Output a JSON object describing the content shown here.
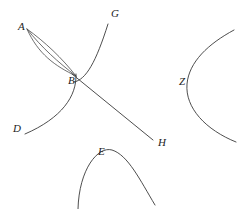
{
  "figure": {
    "background_color": "#ffffff",
    "stroke_color": "#3a3a3a",
    "label_color": "#1c1c1c",
    "width": 243,
    "height": 209,
    "labels": [
      {
        "id": "A",
        "text": "A",
        "x": 18,
        "y": 30
      },
      {
        "id": "B",
        "text": "B",
        "x": 68,
        "y": 84
      },
      {
        "id": "G",
        "text": "G",
        "x": 111,
        "y": 17
      },
      {
        "id": "D",
        "text": "D",
        "x": 13,
        "y": 132
      },
      {
        "id": "H",
        "text": "H",
        "x": 158,
        "y": 146
      },
      {
        "id": "E",
        "text": "E",
        "x": 98,
        "y": 155
      },
      {
        "id": "Z",
        "text": "Z",
        "x": 179,
        "y": 85
      }
    ],
    "curves": [
      {
        "id": "arc-A-B-upper",
        "from": "A",
        "to": "B",
        "path": "M 27 29 C 45 42, 62 58, 76 76"
      },
      {
        "id": "arc-A-B-middle",
        "from": "A",
        "to": "B",
        "path": "M 27 29 C 42 48, 58 62, 76 76"
      },
      {
        "id": "arc-A-B-lower",
        "from": "A",
        "to": "B",
        "path": "M 27 29 C 38 54, 55 66, 76 76"
      },
      {
        "id": "curve-B-G",
        "from": "B",
        "to": "G",
        "path": "M 74 82 C 86 80, 96 62, 108 24"
      },
      {
        "id": "curve-B-D",
        "from": "B",
        "to": "D",
        "path": "M 76 74 C 77 96, 62 118, 25 134"
      },
      {
        "id": "line-B-H",
        "from": "B",
        "to": "H",
        "path": "M 72 74 L 153 140"
      },
      {
        "id": "curve-E-arch",
        "label": "E",
        "path": "M 78 209 C 79 169, 98 146, 112 150 C 128 155, 140 180, 155 205"
      },
      {
        "id": "curve-Z-parabola",
        "label": "Z",
        "path": "M 234 30 C 208 44, 189 62, 187 84 C 185 108, 206 130, 236 142"
      }
    ]
  }
}
